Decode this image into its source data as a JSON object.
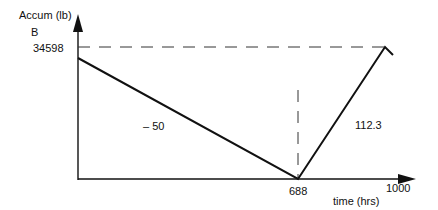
{
  "diagram": {
    "y_axis_label": "Accum (lb)",
    "point_label": "B",
    "y_value_label": "34598",
    "x_axis_label": "time (hrs)",
    "x_tick_mid": "688",
    "x_tick_end": "1000",
    "slope_down_label": "– 50",
    "slope_up_label": "112.3",
    "colors": {
      "line": "#111111",
      "dash": "#333333"
    }
  }
}
